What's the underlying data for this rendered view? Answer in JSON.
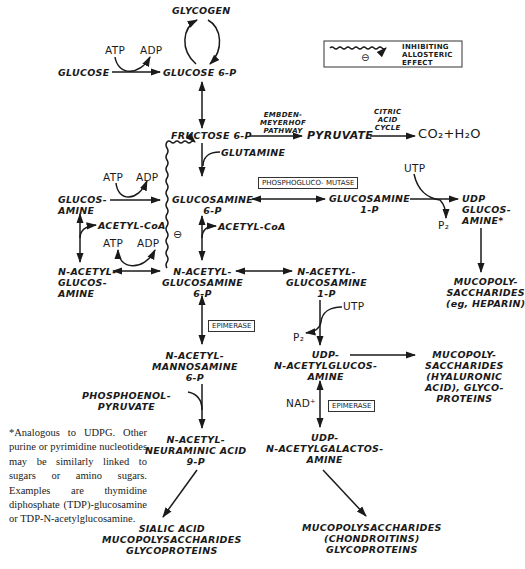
{
  "legend": {
    "label": "INHIBITING\nALLOSTERIC\nEFFECT",
    "symbol": "⊖"
  },
  "metabolites": {
    "glycogen": "GLYCOGEN",
    "glucose": "GLUCOSE",
    "glucose_6p": "GLUCOSE 6-P",
    "fructose_6p": "FRUCTOSE 6-P",
    "pyruvate": "PYRUVATE",
    "co2_h2o": "CO₂+H₂O",
    "glutamine": "GLUTAMINE",
    "glucosamine": "GLUCOS-\nAMINE",
    "glucosamine_6p": "GLUCOSAMINE\n6-P",
    "glucosamine_1p": "GLUCOSAMINE\n1-P",
    "udp_glucosamine": "UDP\nGLUCOS-\nAMINE*",
    "n_acetylglucosamine": "N-ACETYL-\nGLUCOS-\nAMINE",
    "n_acetylglucosamine_6p": "N-ACETYL-\nGLUCOSAMINE\n6-P",
    "n_acetylglucosamine_1p": "N-ACETYL-\nGLUCOSAMINE\n1-P",
    "mucopoly_heparin": "MUCOPOLY-\nSACCHARIDES\n(eg, HEPARIN)",
    "n_acetylmannosamine_6p": "N-ACETYL-\nMANNOSAMINE\n6-P",
    "udp_n_acetylglucosamine": "UDP-\nN-ACETYLGLUCOS-\nAMINE",
    "mucopoly_hyaluronic": "MUCOPOLY-\nSACCHARIDES\n(HYALURONIC\nACID), GLYCO-\nPROTEINS",
    "phosphoenolpyruvate": "PHOSPHOENOL-\nPYRUVATE",
    "n_acetylneuraminic_9p": "N-ACETYL-\nNEURAMINIC ACID\n9-P",
    "udp_n_acetylgalactosamine": "UDP-\nN-ACETYLGALACTOS-\nAMINE",
    "sialic_products": "SIALIC ACID\nMUCOPOLYSACCHARIDES\nGLYCOPROTEINS",
    "chondroitin_products": "MUCOPOLYSACCHARIDES\n(CHONDROITINS)\nGLYCOPROTEINS"
  },
  "cofactors": {
    "atp": "ATP",
    "adp": "ADP",
    "acetyl_coa": "ACETYL-CoA",
    "utp": "UTP",
    "p2": "P₂",
    "nad": "NAD⁺"
  },
  "pathway_labels": {
    "embden_meyerhof": "EMBDEN-\nMEYERHOF\nPATHWAY",
    "citric_acid_cycle": "CITRIC\nACID\nCYCLE"
  },
  "enzymes": {
    "phosphoglucomutase": "PHOSPHOGLUCO-\nMUTASE",
    "epimerase_1": "EPIMERASE",
    "epimerase_2": "EPIMERASE"
  },
  "inhibition_symbol": "⊖",
  "footnote": "*Analogous to UDPG. Other purine or pyrimidine nucleotides may be similarly linked to sugars or amino sugars. Examples are thymidine diphosphate (TDP)-glucosamine or TDP-N-acetylglucosamine."
}
